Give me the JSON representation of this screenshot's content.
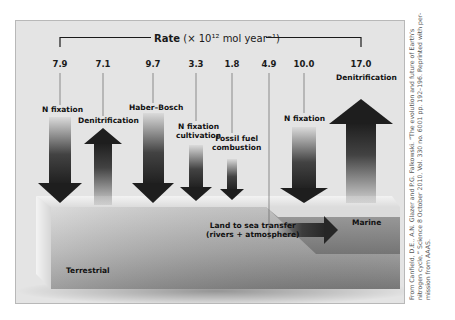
{
  "figure": {
    "title_prefix": "Rate",
    "title_units": "(× 10¹² mol year⁻¹)",
    "regions": {
      "terrestrial": "Terrestrial",
      "marine": "Marine"
    },
    "transfer": {
      "line1": "Land to sea transfer",
      "line2": "(rivers + atmosphere)"
    },
    "fluxes": [
      {
        "value": "7.9",
        "label": "N fixation",
        "direction": "down",
        "x": 59
      },
      {
        "value": "7.1",
        "label": "Denitrification",
        "direction": "up",
        "x": 102
      },
      {
        "value": "9.7",
        "label": "Haber–Bosch",
        "direction": "down",
        "x": 152
      },
      {
        "value": "3.3",
        "label_line1": "N fixation",
        "label_line2": "cultivation",
        "direction": "down",
        "x": 195
      },
      {
        "value": "1.8",
        "label_line1": "Fossil fuel",
        "label_line2": "combustion",
        "direction": "down",
        "x": 231
      },
      {
        "value": "4.9",
        "label": "Land to sea transfer (rivers + atmosphere)",
        "direction": "right",
        "x": 268
      },
      {
        "value": "10.0",
        "label": "N fixation",
        "direction": "down",
        "x": 303
      },
      {
        "value": "17.0",
        "label": "Denitrification",
        "direction": "up",
        "x": 360
      }
    ]
  },
  "caption": {
    "line1": "From Canfield, D.E., A.N. Glazer and P.G. Falkowski. “The evolution and future of Earth’s",
    "line2": "nitrogen cycle,” Science 8 October 2010, Vol. 330 no. 6001 pp. 192–196. Reprinted with per-",
    "line3": "mission from AAAS."
  },
  "colors": {
    "panel_bg": "#e4e4e4",
    "arrow_dark": "#262626",
    "block_front": "#8a8a8a",
    "block_top": "#e8e8e8"
  }
}
